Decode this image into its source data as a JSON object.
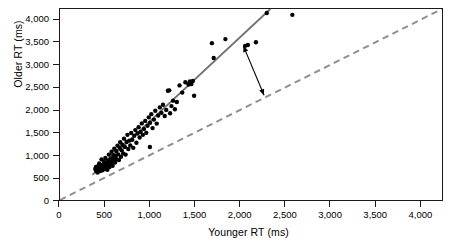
{
  "chart_data": {
    "type": "scatter",
    "title": "",
    "xlabel": "Younger RT (ms)",
    "ylabel": "Older RT (ms)",
    "xlim": [
      0,
      4250
    ],
    "ylim": [
      0,
      4250
    ],
    "xticks": [
      0,
      500,
      1000,
      1500,
      2000,
      2500,
      3000,
      3500,
      4000
    ],
    "xticklabels": [
      "0",
      "500",
      "1,000",
      "1,500",
      "2,000",
      "2,500",
      "3,000",
      "3,500",
      "4,000"
    ],
    "yticks": [
      0,
      500,
      1000,
      1500,
      2000,
      2500,
      3000,
      3500,
      4000
    ],
    "yticklabels": [
      "0",
      "500",
      "1,000",
      "1,500",
      "2,000",
      "2,500",
      "3,000",
      "3,500",
      "4,000"
    ],
    "grid": false,
    "legend": "none",
    "marker": {
      "shape": "circle",
      "color": "#000000",
      "size_px": 4.4
    },
    "points": [
      [
        392,
        690
      ],
      [
        400,
        735
      ],
      [
        405,
        640
      ],
      [
        412,
        705
      ],
      [
        418,
        612
      ],
      [
        425,
        760
      ],
      [
        430,
        668
      ],
      [
        436,
        812
      ],
      [
        441,
        700
      ],
      [
        447,
        645
      ],
      [
        452,
        742
      ],
      [
        458,
        688
      ],
      [
        462,
        905
      ],
      [
        468,
        735
      ],
      [
        472,
        660
      ],
      [
        478,
        790
      ],
      [
        484,
        715
      ],
      [
        489,
        852
      ],
      [
        494,
        690
      ],
      [
        500,
        760
      ],
      [
        505,
        935
      ],
      [
        510,
        700
      ],
      [
        516,
        820
      ],
      [
        521,
        745
      ],
      [
        527,
        672
      ],
      [
        533,
        880
      ],
      [
        538,
        790
      ],
      [
        544,
        1010
      ],
      [
        550,
        735
      ],
      [
        556,
        860
      ],
      [
        562,
        925
      ],
      [
        568,
        800
      ],
      [
        574,
        1075
      ],
      [
        580,
        880
      ],
      [
        586,
        760
      ],
      [
        592,
        1000
      ],
      [
        598,
        915
      ],
      [
        604,
        1140
      ],
      [
        612,
        835
      ],
      [
        618,
        975
      ],
      [
        625,
        1090
      ],
      [
        632,
        905
      ],
      [
        640,
        1210
      ],
      [
        648,
        1015
      ],
      [
        656,
        890
      ],
      [
        663,
        1160
      ],
      [
        670,
        1285
      ],
      [
        678,
        960
      ],
      [
        686,
        1105
      ],
      [
        694,
        1230
      ],
      [
        702,
        1035
      ],
      [
        712,
        1365
      ],
      [
        722,
        1180
      ],
      [
        730,
        1010
      ],
      [
        740,
        1290
      ],
      [
        750,
        1450
      ],
      [
        760,
        1135
      ],
      [
        770,
        1320
      ],
      [
        782,
        1215
      ],
      [
        792,
        1490
      ],
      [
        804,
        1340
      ],
      [
        815,
        1160
      ],
      [
        826,
        1430
      ],
      [
        838,
        1555
      ],
      [
        850,
        1275
      ],
      [
        862,
        1480
      ],
      [
        874,
        1620
      ],
      [
        886,
        1390
      ],
      [
        898,
        1515
      ],
      [
        910,
        1705
      ],
      [
        922,
        1450
      ],
      [
        934,
        1580
      ],
      [
        948,
        1760
      ],
      [
        960,
        1495
      ],
      [
        974,
        1650
      ],
      [
        988,
        1840
      ],
      [
        1000,
        1180
      ],
      [
        1002,
        1720
      ],
      [
        1016,
        1910
      ],
      [
        1030,
        1600
      ],
      [
        1045,
        1790
      ],
      [
        1060,
        1985
      ],
      [
        1076,
        1700
      ],
      [
        1092,
        1880
      ],
      [
        1110,
        2060
      ],
      [
        1128,
        1940
      ],
      [
        1146,
        2120
      ],
      [
        1165,
        1870
      ],
      [
        1182,
        2005
      ],
      [
        1200,
        2430
      ],
      [
        1215,
        2440
      ],
      [
        1225,
        1930
      ],
      [
        1240,
        2090
      ],
      [
        1258,
        2210
      ],
      [
        1278,
        2020
      ],
      [
        1300,
        2180
      ],
      [
        1330,
        2550
      ],
      [
        1360,
        2390
      ],
      [
        1395,
        2620
      ],
      [
        1430,
        2570
      ],
      [
        1445,
        2640
      ],
      [
        1462,
        2580
      ],
      [
        1478,
        2650
      ],
      [
        1492,
        2320
      ],
      [
        1690,
        3490
      ],
      [
        1710,
        3160
      ],
      [
        1840,
        3580
      ],
      [
        2060,
        3430
      ],
      [
        2090,
        3450
      ],
      [
        2180,
        3510
      ],
      [
        2300,
        4160
      ],
      [
        2585,
        4120
      ]
    ],
    "lines": [
      {
        "name": "regression-line",
        "style": "solid",
        "color": "#6f7376",
        "width_px": 1.9,
        "x": [
          360,
          2340
        ],
        "y": [
          560,
          4250
        ]
      },
      {
        "name": "identity-line",
        "style": "dashed",
        "color": "#8c9094",
        "width_px": 2.0,
        "x": [
          0,
          4250
        ],
        "y": [
          0,
          4250
        ]
      }
    ],
    "annotations": [
      {
        "name": "gap-arrow",
        "type": "double-headed-arrow",
        "color": "#000000",
        "x": [
          2040,
          2270
        ],
        "y": [
          3430,
          2330
        ]
      }
    ]
  }
}
